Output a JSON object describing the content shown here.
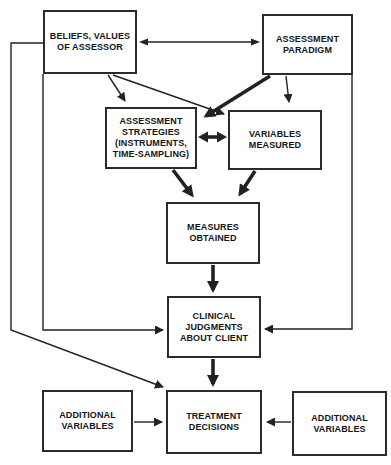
{
  "diagram": {
    "colors": {
      "line": "#222222",
      "box_border": "#2b2b2b",
      "text": "#151515",
      "background": "#ffffff"
    },
    "boxes": {
      "beliefs": {
        "label": "BELIEFS, VALUES\nOF ASSESSOR"
      },
      "paradigm": {
        "label": "ASSESSMENT\nPARADIGM"
      },
      "strategies": {
        "label": "ASSESSMENT\nSTRATEGIES\n(INSTRUMENTS,\nTIME-SAMPLING)"
      },
      "variables": {
        "label": "VARIABLES\nMEASURED"
      },
      "measures": {
        "label": "MEASURES\nOBTAINED"
      },
      "clinical": {
        "label": "CLINICAL\nJUDGMENTS\nABOUT CLIENT"
      },
      "additional_left": {
        "label": "ADDITIONAL\nVARIABLES"
      },
      "treatment": {
        "label": "TREATMENT\nDECISIONS"
      },
      "additional_right": {
        "label": "ADDITIONAL\nVARIABLES"
      }
    },
    "connections": [
      {
        "from": "beliefs-values-of-assessor",
        "to": "assessment-paradigm",
        "type": "double",
        "weight": "thin"
      },
      {
        "from": "beliefs-values-of-assessor",
        "to": "assessment-strategies",
        "type": "single",
        "weight": "thin"
      },
      {
        "from": "beliefs-values-of-assessor",
        "to": "variables-measured",
        "type": "single",
        "weight": "thin"
      },
      {
        "from": "beliefs-values-of-assessor",
        "to": "clinical-judgments-about-client",
        "type": "single",
        "weight": "thin"
      },
      {
        "from": "beliefs-values-of-assessor",
        "to": "treatment-decisions",
        "type": "single",
        "weight": "thin"
      },
      {
        "from": "assessment-paradigm",
        "to": "assessment-strategies",
        "type": "single",
        "weight": "thick"
      },
      {
        "from": "assessment-paradigm",
        "to": "variables-measured",
        "type": "single",
        "weight": "thin"
      },
      {
        "from": "assessment-paradigm",
        "to": "clinical-judgments-about-client",
        "type": "single",
        "weight": "thin"
      },
      {
        "from": "assessment-strategies",
        "to": "variables-measured",
        "type": "double",
        "weight": "thick"
      },
      {
        "from": "assessment-strategies",
        "to": "measures-obtained",
        "type": "single",
        "weight": "thick"
      },
      {
        "from": "variables-measured",
        "to": "measures-obtained",
        "type": "single",
        "weight": "thick"
      },
      {
        "from": "measures-obtained",
        "to": "clinical-judgments-about-client",
        "type": "single",
        "weight": "thick"
      },
      {
        "from": "clinical-judgments-about-client",
        "to": "treatment-decisions",
        "type": "single",
        "weight": "thick"
      },
      {
        "from": "additional-variables-left",
        "to": "treatment-decisions",
        "type": "single",
        "weight": "thin"
      },
      {
        "from": "additional-variables-right",
        "to": "treatment-decisions",
        "type": "single",
        "weight": "thin"
      }
    ]
  }
}
